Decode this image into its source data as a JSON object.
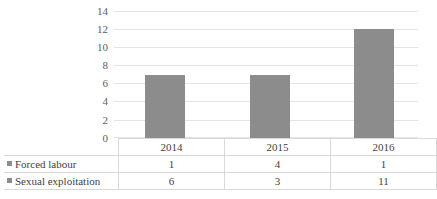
{
  "chart_data": {
    "type": "bar",
    "title": "",
    "subtitle": "",
    "xlabel": "",
    "ylabel": "",
    "categories": [
      "2014",
      "2015",
      "2016"
    ],
    "values": [
      7,
      7,
      12
    ],
    "ylim": [
      0,
      14
    ],
    "yticks": [
      0,
      2,
      4,
      6,
      8,
      10,
      12,
      14
    ],
    "ytick_labels": [
      "0",
      "2",
      "4",
      "6",
      "8",
      "10",
      "12",
      "14"
    ],
    "grid": true,
    "legend_position": "table-left",
    "series": [
      {
        "name": "Forced labour",
        "values": [
          1,
          4,
          1
        ],
        "color": "#8c8c8c"
      },
      {
        "name": "Sexual exploitation",
        "values": [
          6,
          3,
          11
        ],
        "color": "#8c8c8c"
      }
    ],
    "annotations": []
  },
  "colors": {
    "bar": "#8c8c8c",
    "gridline": "#e4e4e4",
    "table_border": "#d9d9d9",
    "text": "#3f3f3f",
    "axis_text": "#5c5c5c",
    "background": "#ffffff"
  },
  "table": {
    "header_row": [
      "",
      "2014",
      "2015",
      "2016"
    ],
    "rows": [
      {
        "label": "Forced labour",
        "marker": "legend-square-icon",
        "values": [
          "1",
          "4",
          "1"
        ]
      },
      {
        "label": "Sexual exploitation",
        "marker": "legend-square-icon",
        "values": [
          "6",
          "3",
          "11"
        ]
      }
    ]
  },
  "axis": {
    "y_ticks": [
      "14",
      "12",
      "10",
      "8",
      "6",
      "4",
      "2",
      "0"
    ]
  }
}
